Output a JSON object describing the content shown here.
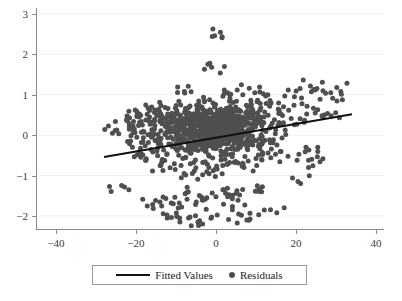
{
  "chart_data": {
    "type": "scatter",
    "title": "",
    "subtitle": "",
    "xlabel": "",
    "ylabel": "",
    "xlim": [
      -45,
      42
    ],
    "ylim": [
      -2.35,
      3.15
    ],
    "grid": "horizontal-faint",
    "legend_position": "bottom-outside",
    "x_ticks": [
      -40,
      -20,
      0,
      20,
      40
    ],
    "y_ticks": [
      -2,
      -1,
      0,
      1,
      2,
      3
    ],
    "x_tick_labels": [
      "-40",
      "-20",
      "0",
      "20",
      "40"
    ],
    "y_tick_labels": [
      "-2",
      "-1",
      "0",
      "1",
      "2",
      "3"
    ],
    "marker_color": "#4f4f4f",
    "line_color": "#111111",
    "series": [
      {
        "name": "Residuals",
        "type": "scatter",
        "marker": "circle",
        "x": [
          -24.8,
          -23.6,
          -22.1,
          -21.4,
          -20.9,
          -20.2,
          -19.8,
          -19.3,
          -18.8,
          -18.4,
          -18.0,
          -17.6,
          -17.2,
          -16.9,
          -16.5,
          -16.1,
          -15.8,
          -15.4,
          -15.1,
          -14.8,
          -14.4,
          -14.1,
          -13.8,
          -13.5,
          -13.2,
          -12.9,
          -12.6,
          -12.3,
          -12.0,
          -11.8,
          -11.5,
          -11.2,
          -11.0,
          -10.7,
          -10.5,
          -10.2,
          -10.0,
          -9.8,
          -9.5,
          -9.3,
          -9.1,
          -8.9,
          -8.7,
          -8.5,
          -8.3,
          -8.1,
          -7.9,
          -7.7,
          -7.5,
          -7.3,
          -7.1,
          -6.9,
          -6.7,
          -6.5,
          -6.3,
          -6.1,
          -5.9,
          -5.7,
          -5.5,
          -5.3,
          -5.1,
          -4.9,
          -4.7,
          -4.5,
          -4.3,
          -4.1,
          -3.9,
          -3.7,
          -3.5,
          -3.3,
          -3.1,
          -2.9,
          -2.7,
          -2.5,
          -2.3,
          -2.1,
          -1.9,
          -1.7,
          -1.5,
          -1.3,
          -1.1,
          -0.9,
          -0.7,
          -0.5,
          -0.3,
          -0.1,
          0.1,
          0.3,
          0.5,
          0.7,
          0.9,
          1.1,
          1.3,
          1.5,
          1.7,
          1.9,
          2.1,
          2.3,
          2.5,
          2.7,
          2.9,
          3.1,
          3.3,
          3.5,
          3.7,
          3.9,
          4.1,
          4.3,
          4.5,
          4.7,
          4.9,
          5.1,
          5.3,
          5.5,
          5.7,
          5.9,
          6.1,
          6.4,
          6.7,
          7.0,
          7.3,
          7.6,
          7.9,
          8.2,
          8.5,
          8.8,
          9.1,
          9.4,
          9.7,
          10.0,
          10.4,
          10.8,
          11.2,
          11.6,
          12.0,
          12.5,
          13.0,
          13.5,
          14.0,
          14.6,
          15.2,
          15.8,
          16.5,
          17.2,
          18.0,
          18.8,
          19.6,
          20.5,
          21.5,
          22.5,
          23.6,
          24.8,
          26.0,
          27.4,
          28.8,
          30.2,
          31.6
        ],
        "y": [
          0.13,
          -1.25,
          0.35,
          0.18,
          -0.3,
          0.62,
          -0.05,
          0.45,
          -0.55,
          0.25,
          0.08,
          -0.62,
          0.52,
          -0.18,
          0.33,
          0.7,
          -0.42,
          0.15,
          -1.62,
          0.48,
          -0.08,
          0.58,
          -0.75,
          0.28,
          -1.95,
          0.4,
          0.05,
          -0.48,
          0.66,
          -0.22,
          0.31,
          -1.68,
          0.54,
          -0.1,
          0.44,
          -0.85,
          0.22,
          0.61,
          -0.35,
          0.17,
          -2.05,
          0.49,
          -0.02,
          0.37,
          -0.58,
          0.27,
          1.08,
          -0.15,
          0.43,
          -1.42,
          0.56,
          -0.28,
          0.34,
          0.72,
          -0.45,
          0.2,
          -0.95,
          0.47,
          -0.06,
          0.39,
          -1.72,
          0.29,
          0.64,
          -0.38,
          0.24,
          -2.12,
          0.51,
          -0.12,
          0.41,
          -0.68,
          0.3,
          0.83,
          -0.25,
          0.46,
          -1.55,
          0.36,
          0.05,
          -0.52,
          0.59,
          -0.19,
          1.68,
          0.42,
          -0.88,
          0.26,
          0.69,
          -0.33,
          0.18,
          -1.98,
          0.53,
          -0.08,
          0.38,
          2.55,
          0.63,
          -0.42,
          0.23,
          -1.35,
          0.48,
          0.02,
          0.35,
          -0.72,
          0.57,
          -0.21,
          0.44,
          0.91,
          -0.48,
          0.29,
          -1.85,
          0.52,
          -0.11,
          0.4,
          -0.65,
          0.33,
          1.12,
          -0.27,
          0.46,
          -1.48,
          0.6,
          -0.05,
          0.37,
          -0.8,
          0.25,
          0.74,
          -0.36,
          0.5,
          -2.08,
          0.42,
          -0.14,
          0.31,
          1.05,
          -0.58,
          0.55,
          -0.24,
          0.67,
          -1.28,
          0.45,
          0.09,
          -0.44,
          0.86,
          -0.18,
          0.38,
          -1.92,
          0.62,
          -0.07,
          0.97,
          -0.52,
          0.41,
          0.26,
          -1.15,
          0.78,
          -0.3,
          1.22,
          0.55,
          -0.66,
          1.04,
          0.48,
          1.18,
          0.88
        ]
      },
      {
        "name": "Fitted Values",
        "type": "line",
        "x_endpoints": [
          -28,
          34
        ],
        "y_endpoints": [
          -0.54,
          0.52
        ],
        "slope": 0.0171,
        "intercept": -0.061
      }
    ]
  },
  "legend": {
    "entries": [
      {
        "label": "Fitted Values",
        "swatch": "line-swatch"
      },
      {
        "label": "Residuals",
        "swatch": "dot-swatch"
      }
    ]
  },
  "caption": {
    "text": ""
  }
}
